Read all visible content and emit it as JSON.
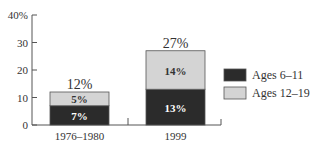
{
  "chart_data": {
    "type": "bar",
    "stacked": true,
    "title": "",
    "xlabel": "",
    "ylabel": "",
    "ylim": [
      0,
      40
    ],
    "yticks": [
      0,
      10,
      20,
      30,
      40
    ],
    "ytick_labels": [
      "0",
      "10",
      "20",
      "30",
      "40%"
    ],
    "categories": [
      "1976–1980",
      "1999"
    ],
    "series": [
      {
        "name": "Ages 6–11",
        "values": [
          7,
          13
        ],
        "labels": [
          "7%",
          "13%"
        ],
        "color": "#2b2b2b"
      },
      {
        "name": "Ages 12–19",
        "values": [
          5,
          14
        ],
        "labels": [
          "5%",
          "14%"
        ],
        "color": "#d4d4d4"
      }
    ],
    "totals": [
      12,
      27
    ],
    "total_labels": [
      "12%",
      "27%"
    ],
    "legend_position": "right",
    "grid": false
  },
  "legend": {
    "items": [
      {
        "label": "Ages 6–11",
        "color": "#2b2b2b"
      },
      {
        "label": "Ages 12–19",
        "color": "#d4d4d4"
      }
    ]
  }
}
